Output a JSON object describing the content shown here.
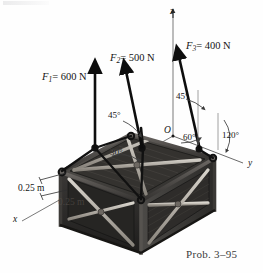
{
  "figure": {
    "caption": "Prob. 3–95",
    "origin_label": "O",
    "axes": [
      {
        "name": "z",
        "label": "z"
      },
      {
        "name": "y",
        "label": "y"
      },
      {
        "name": "x",
        "label": "x"
      }
    ],
    "forces": [
      {
        "id": "F1",
        "symbol": "F",
        "subscript": "1",
        "value": "= 600 N",
        "full": "F1 = 600 N",
        "magnitude": 600,
        "unit": "N"
      },
      {
        "id": "F2",
        "symbol": "F",
        "subscript": "2",
        "value": "= 500 N",
        "full": "F2 = 500 N",
        "magnitude": 500,
        "unit": "N"
      },
      {
        "id": "F3",
        "symbol": "F",
        "subscript": "3",
        "value": "= 400 N",
        "full": "F3 = 400 N",
        "magnitude": 400,
        "unit": "N"
      }
    ],
    "angles": [
      {
        "id": "angle-f2-45",
        "label": "45°",
        "value": 45
      },
      {
        "id": "angle-f2-30",
        "label": "30°",
        "value": 30
      },
      {
        "id": "angle-f3-45",
        "label": "45°",
        "value": 45
      },
      {
        "id": "angle-f3-60",
        "label": "60°",
        "value": 60
      },
      {
        "id": "angle-f3-120",
        "label": "120°",
        "value": 120
      }
    ],
    "dimensions": [
      {
        "id": "dim-upper",
        "label": "0.25 m",
        "value": 0.25,
        "unit": "m"
      },
      {
        "id": "dim-lower",
        "label": "0.25 m",
        "value": 0.25,
        "unit": "m"
      }
    ],
    "colors": {
      "crate_dark": "#2c2c2c",
      "crate_mid": "#4a4846",
      "crate_light": "#9b968f",
      "brace": "#b8b3ab",
      "sling": "#1a1a1a",
      "arrow": "#0d0d0d",
      "axis": "#6a6a6a",
      "text": "#141414",
      "background": "#fefefe"
    }
  }
}
